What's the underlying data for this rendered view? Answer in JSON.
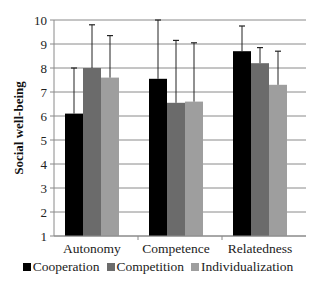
{
  "chart_data": {
    "type": "bar",
    "title": "",
    "xlabel": "",
    "ylabel": "Social well-being",
    "ylim": [
      1,
      10
    ],
    "yticks": [
      1,
      2,
      3,
      4,
      5,
      6,
      7,
      8,
      9,
      10
    ],
    "grid": true,
    "legend_position": "bottom",
    "categories": [
      "Autonomy",
      "Competence",
      "Relatedness"
    ],
    "series": [
      {
        "name": "Cooperation",
        "color": "#000000",
        "values": [
          6.1,
          7.55,
          8.7
        ],
        "error_upper": [
          8.0,
          10.0,
          9.75
        ]
      },
      {
        "name": "Competition",
        "color": "#6b6b6b",
        "values": [
          8.0,
          6.55,
          8.2
        ],
        "error_upper": [
          9.8,
          9.15,
          8.85
        ]
      },
      {
        "name": "Individualization",
        "color": "#9e9e9e",
        "values": [
          7.6,
          6.6,
          7.3
        ],
        "error_upper": [
          9.35,
          9.05,
          8.7
        ]
      }
    ]
  }
}
